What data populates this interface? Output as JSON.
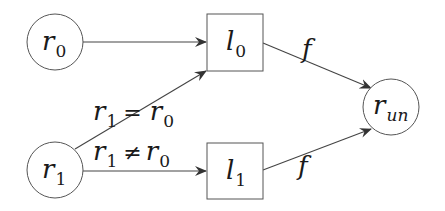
{
  "diagram": {
    "type": "flow-graph",
    "nodes": [
      {
        "id": "r0",
        "shape": "circle",
        "label": "r",
        "subscript": "0"
      },
      {
        "id": "r1",
        "shape": "circle",
        "label": "r",
        "subscript": "1"
      },
      {
        "id": "l0",
        "shape": "box",
        "label": "l",
        "subscript": "0"
      },
      {
        "id": "l1",
        "shape": "box",
        "label": "l",
        "subscript": "1"
      },
      {
        "id": "run",
        "shape": "circle",
        "label": "r",
        "subscript": "un"
      }
    ],
    "edges": [
      {
        "from": "r0",
        "to": "l0",
        "label": ""
      },
      {
        "from": "r1",
        "to": "l0",
        "label_var1": "r",
        "label_sub1": "1",
        "label_op": "=",
        "label_var2": "r",
        "label_sub2": "0"
      },
      {
        "from": "r1",
        "to": "l1",
        "label_var1": "r",
        "label_sub1": "1",
        "label_op": "≠",
        "label_var2": "r",
        "label_sub2": "0"
      },
      {
        "from": "l0",
        "to": "run",
        "label": "f"
      },
      {
        "from": "l1",
        "to": "run",
        "label": "f"
      }
    ],
    "colors": {
      "stroke": "#555555",
      "text": "#1a1a1a",
      "background": "#ffffff"
    }
  }
}
